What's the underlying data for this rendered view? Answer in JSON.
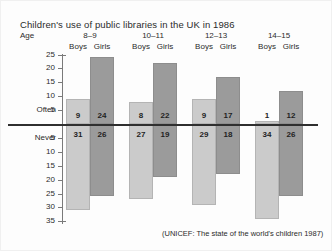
{
  "chart_data": {
    "type": "bar",
    "title": "Children's use of public libraries in the UK in 1986",
    "source": "(UNICEF: The state of the world's children 1987)",
    "age_axis_label": "Age",
    "categories": [
      "8–9",
      "10–11",
      "12–13",
      "14–15"
    ],
    "subcategories": [
      "Boys",
      "Girls"
    ],
    "series": [
      {
        "name": "Often",
        "direction": "up",
        "values": [
          [
            9,
            24
          ],
          [
            8,
            22
          ],
          [
            9,
            17
          ],
          [
            1,
            12
          ]
        ]
      },
      {
        "name": "Never",
        "direction": "down",
        "values": [
          [
            31,
            26
          ],
          [
            27,
            19
          ],
          [
            29,
            18
          ],
          [
            34,
            26
          ]
        ]
      }
    ],
    "yticks_positive": [
      25,
      20,
      15,
      10,
      5
    ],
    "yticks_negative": [
      5,
      10,
      15,
      20,
      25,
      30,
      35
    ],
    "ylim": [
      -35,
      25
    ],
    "grid": false,
    "legend": "none",
    "xlabel": "Age",
    "ylabel": "",
    "colors": {
      "boys": "#cbcbcb",
      "girls": "#9b9b9b",
      "zero_line": "#2f2f2f",
      "axis": "#7a7a7a",
      "text": "#2b2b2b"
    }
  },
  "geometry": {
    "zero_y": 124,
    "px_per_unit": 2.78,
    "bar_width": 24,
    "group_left": [
      66,
      129,
      192,
      255
    ],
    "often_label_top": 111,
    "never_label_top": 130
  }
}
